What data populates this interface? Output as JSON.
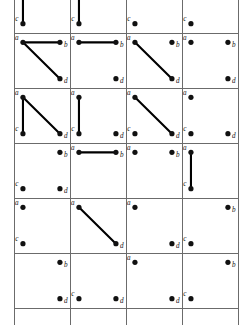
{
  "figure": {
    "vertex_labels": [
      "a",
      "b",
      "c",
      "d"
    ],
    "colors": {
      "background": "#ffffff",
      "grid_line": "#6b6b6b",
      "edge": "#000000",
      "vertex": "#111111",
      "label": "#111111"
    },
    "layout": {
      "columns": 4,
      "rows_visible": 7,
      "cell_width": 56,
      "cell_height": 55,
      "grid_left": 14,
      "grid_top": -22,
      "grid_right": 237,
      "grid_bottom": 325,
      "first_row_clipped": true,
      "last_row_clipped": true
    },
    "vertex_positions": {
      "a": [
        0.16,
        0.17
      ],
      "b": [
        0.82,
        0.17
      ],
      "c": [
        0.16,
        0.83
      ],
      "d": [
        0.82,
        0.83
      ]
    }
  },
  "chart_data": {
    "type": "diagram-grid",
    "node_names": [
      "a",
      "b",
      "c",
      "d"
    ],
    "columns": 4,
    "panels": [
      {
        "row": 0,
        "col": 0,
        "clipped": true,
        "nodes": [
          "c"
        ],
        "edges": [
          [
            "c",
            "up"
          ]
        ]
      },
      {
        "row": 0,
        "col": 1,
        "clipped": true,
        "nodes": [
          "c"
        ],
        "edges": [
          [
            "c",
            "up"
          ]
        ]
      },
      {
        "row": 0,
        "col": 2,
        "clipped": true,
        "nodes": [
          "c"
        ],
        "edges": []
      },
      {
        "row": 0,
        "col": 3,
        "clipped": true,
        "nodes": [
          "c"
        ],
        "edges": []
      },
      {
        "row": 1,
        "col": 0,
        "clipped": false,
        "nodes": [
          "a",
          "b",
          "d"
        ],
        "edges": [
          [
            "a",
            "b"
          ],
          [
            "a",
            "d"
          ]
        ]
      },
      {
        "row": 1,
        "col": 1,
        "clipped": false,
        "nodes": [
          "a",
          "b",
          "d"
        ],
        "edges": [
          [
            "a",
            "b"
          ]
        ]
      },
      {
        "row": 1,
        "col": 2,
        "clipped": false,
        "nodes": [
          "a",
          "b",
          "d"
        ],
        "edges": [
          [
            "a",
            "d"
          ]
        ]
      },
      {
        "row": 1,
        "col": 3,
        "clipped": false,
        "nodes": [
          "a",
          "b",
          "d"
        ],
        "edges": []
      },
      {
        "row": 2,
        "col": 0,
        "clipped": false,
        "nodes": [
          "a",
          "c",
          "d"
        ],
        "edges": [
          [
            "a",
            "c"
          ],
          [
            "a",
            "d"
          ]
        ]
      },
      {
        "row": 2,
        "col": 1,
        "clipped": false,
        "nodes": [
          "a",
          "c",
          "d"
        ],
        "edges": [
          [
            "a",
            "c"
          ]
        ]
      },
      {
        "row": 2,
        "col": 2,
        "clipped": false,
        "nodes": [
          "a",
          "c",
          "d"
        ],
        "edges": [
          [
            "a",
            "d"
          ]
        ]
      },
      {
        "row": 2,
        "col": 3,
        "clipped": false,
        "nodes": [
          "a",
          "c",
          "d"
        ],
        "edges": []
      },
      {
        "row": 3,
        "col": 0,
        "clipped": false,
        "nodes": [
          "b",
          "c",
          "d"
        ],
        "edges": []
      },
      {
        "row": 3,
        "col": 1,
        "clipped": false,
        "nodes": [
          "a",
          "b"
        ],
        "edges": [
          [
            "a",
            "b"
          ]
        ]
      },
      {
        "row": 3,
        "col": 2,
        "clipped": false,
        "nodes": [
          "a",
          "b"
        ],
        "edges": []
      },
      {
        "row": 3,
        "col": 3,
        "clipped": false,
        "nodes": [
          "a",
          "c"
        ],
        "edges": [
          [
            "a",
            "c"
          ]
        ]
      },
      {
        "row": 4,
        "col": 0,
        "clipped": false,
        "nodes": [
          "a",
          "c"
        ],
        "edges": []
      },
      {
        "row": 4,
        "col": 1,
        "clipped": false,
        "nodes": [
          "a",
          "d"
        ],
        "edges": [
          [
            "a",
            "d"
          ]
        ]
      },
      {
        "row": 4,
        "col": 2,
        "clipped": false,
        "nodes": [
          "a",
          "d"
        ],
        "edges": []
      },
      {
        "row": 4,
        "col": 3,
        "clipped": false,
        "nodes": [
          "b",
          "c"
        ],
        "edges": []
      },
      {
        "row": 5,
        "col": 0,
        "clipped": false,
        "nodes": [
          "b",
          "d"
        ],
        "edges": []
      },
      {
        "row": 5,
        "col": 1,
        "clipped": false,
        "nodes": [
          "c",
          "d"
        ],
        "edges": []
      },
      {
        "row": 5,
        "col": 2,
        "clipped": false,
        "nodes": [
          "a",
          "d"
        ],
        "edges": []
      },
      {
        "row": 5,
        "col": 3,
        "clipped": false,
        "nodes": [
          "b",
          "c"
        ],
        "edges": []
      },
      {
        "row": 6,
        "col": 0,
        "clipped": true,
        "nodes": [],
        "edges": []
      },
      {
        "row": 6,
        "col": 1,
        "clipped": true,
        "nodes": [],
        "edges": []
      },
      {
        "row": 6,
        "col": 2,
        "clipped": true,
        "nodes": [],
        "edges": []
      },
      {
        "row": 6,
        "col": 3,
        "clipped": true,
        "nodes": [],
        "edges": []
      }
    ]
  }
}
